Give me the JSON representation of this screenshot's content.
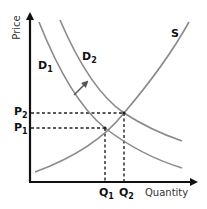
{
  "diagram": {
    "axes": {
      "y_label": "Price",
      "x_label": "Quantity"
    },
    "curves": [
      {
        "id": "S",
        "label": "S",
        "type": "supply"
      },
      {
        "id": "D1",
        "label": "D",
        "subscript": "1",
        "type": "demand"
      },
      {
        "id": "D2",
        "label": "D",
        "subscript": "2",
        "type": "demand"
      }
    ],
    "shift_arrow": {
      "from": "D1",
      "to": "D2",
      "direction": "outward"
    },
    "equilibria": [
      {
        "price_label": "P",
        "price_sub": "1",
        "quantity_label": "Q",
        "quantity_sub": "1"
      },
      {
        "price_label": "P",
        "price_sub": "2",
        "quantity_label": "Q",
        "quantity_sub": "2"
      }
    ],
    "colors": {
      "axis": "#111111",
      "curve": "#8a8a8a",
      "guide": "#222222",
      "text": "#111111"
    }
  }
}
